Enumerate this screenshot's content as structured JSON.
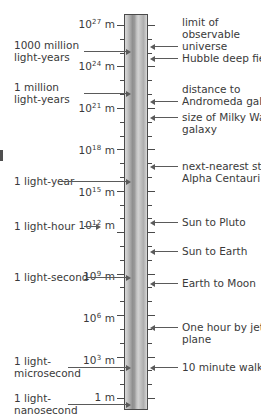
{
  "figure": {
    "type": "logarithmic-distance-scale",
    "unit": "m",
    "axis_label_suffix": "m",
    "scale_top_exponent": 27,
    "scale_bottom_exponent": 0,
    "decade_spacing_px": 13.9
  },
  "scale_labels": [
    {
      "id": "e27",
      "mantissa": "10",
      "exponent": "27",
      "unit": "m",
      "text": "10²⁷ m",
      "exp_value": 27,
      "y": 25
    },
    {
      "id": "e24",
      "mantissa": "10",
      "exponent": "24",
      "unit": "m",
      "text": "10²⁴ m",
      "exp_value": 24,
      "y": 67
    },
    {
      "id": "e21",
      "mantissa": "10",
      "exponent": "21",
      "unit": "m",
      "text": "10²¹ m",
      "exp_value": 21,
      "y": 109
    },
    {
      "id": "e18",
      "mantissa": "10",
      "exponent": "18",
      "unit": "m",
      "text": "10¹⁸ m",
      "exp_value": 18,
      "y": 151
    },
    {
      "id": "e15",
      "mantissa": "10",
      "exponent": "15",
      "unit": "m",
      "text": "10¹⁵ m",
      "exp_value": 15,
      "y": 193
    },
    {
      "id": "e12",
      "mantissa": "10",
      "exponent": "12",
      "unit": "m",
      "text": "10¹² m",
      "exp_value": 12,
      "y": 226
    },
    {
      "id": "e9",
      "mantissa": "10",
      "exponent": "9",
      "unit": "m",
      "text": "10⁹ m",
      "exp_value": 9,
      "y": 277
    },
    {
      "id": "e6",
      "mantissa": "10",
      "exponent": "6",
      "unit": "m",
      "text": "10⁶ m",
      "exp_value": 6,
      "y": 319
    },
    {
      "id": "e3",
      "mantissa": "10",
      "exponent": "3",
      "unit": "m",
      "text": "10³ m",
      "exp_value": 3,
      "y": 361
    },
    {
      "id": "e0",
      "mantissa": "1",
      "exponent": "",
      "unit": "m",
      "text": "1 m",
      "exp_value": 0,
      "y": 398
    }
  ],
  "left_annotations": [
    {
      "id": "gly-1000m",
      "line1": "1000 million",
      "line2": "light-years",
      "y": 51
    },
    {
      "id": "gly-1m",
      "line1": "1 million",
      "line2": "light-years",
      "y": 93
    },
    {
      "id": "light-year",
      "line1": "1 light-year",
      "line2": "",
      "y": 181
    },
    {
      "id": "light-hour",
      "line1": "1 light-hour",
      "line2": "",
      "y": 226
    },
    {
      "id": "light-second",
      "line1": "1 light-second",
      "line2": "",
      "y": 277
    },
    {
      "id": "light-microsecond",
      "line1": "1 light-",
      "line2": "microsecond",
      "y": 367
    },
    {
      "id": "light-nanosecond",
      "line1": "1 light-",
      "line2": "nanosecond",
      "y": 404
    }
  ],
  "right_annotations": [
    {
      "id": "observable-universe",
      "lines": [
        "limit of",
        "observable",
        "universe"
      ],
      "y": 16
    },
    {
      "id": "hubble-deep-field",
      "lines": [
        "Hubble deep field"
      ],
      "y": 52
    },
    {
      "id": "andromeda-galaxy",
      "lines": [
        "distance to",
        "Andromeda galaxy"
      ],
      "y": 83
    },
    {
      "id": "milky-way-size",
      "lines": [
        "size of Milky Way",
        "galaxy"
      ],
      "y": 111
    },
    {
      "id": "alpha-centauri",
      "lines": [
        "next-nearest star",
        "Alpha Centauri"
      ],
      "y": 160
    },
    {
      "id": "sun-to-pluto",
      "lines": [
        "Sun to Pluto"
      ],
      "y": 216
    },
    {
      "id": "sun-to-earth",
      "lines": [
        "Sun to Earth"
      ],
      "y": 245
    },
    {
      "id": "earth-to-moon",
      "lines": [
        "Earth to Moon"
      ],
      "y": 277
    },
    {
      "id": "jet-plane-hour",
      "lines": [
        "One hour by jet",
        "plane"
      ],
      "y": 321
    },
    {
      "id": "ten-minute-walk",
      "lines": [
        "10 minute walk"
      ],
      "y": 361
    }
  ],
  "colors": {
    "ink": "#3a3a3a",
    "leader": "#5a5a5a",
    "column_border": "#4a4a4a",
    "background": "#ffffff"
  }
}
